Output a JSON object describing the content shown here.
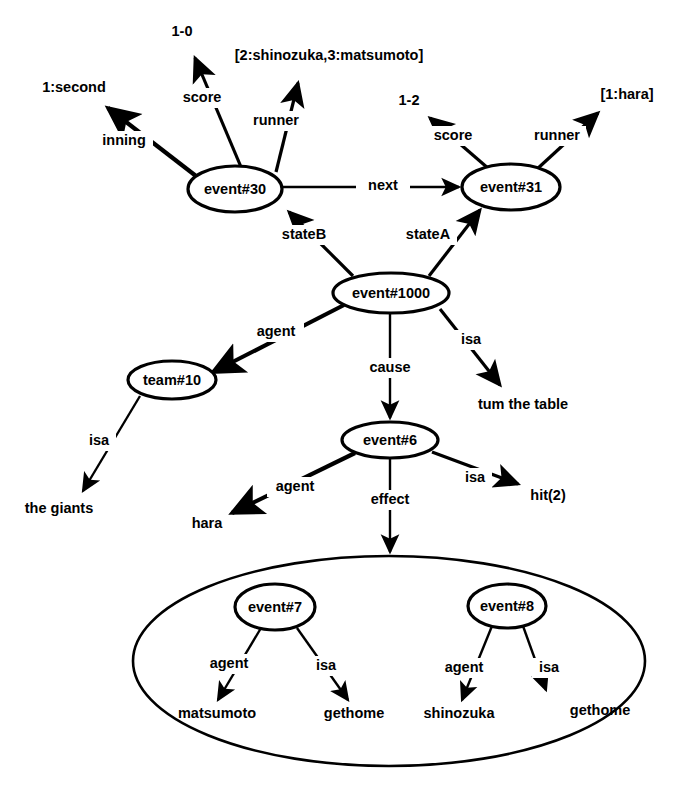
{
  "diagram": {
    "ink_color": "#000000",
    "background_color": "#ffffff",
    "nodes": {
      "event30": {
        "label": "event#30",
        "cx": 235,
        "cy": 189,
        "rx": 47,
        "ry": 23
      },
      "event31": {
        "label": "event#31",
        "cx": 511,
        "cy": 187,
        "rx": 49,
        "ry": 23
      },
      "event1000": {
        "label": "event#1000",
        "cx": 391,
        "cy": 293,
        "rx": 58,
        "ry": 20
      },
      "team10": {
        "label": "team#10",
        "cx": 172,
        "cy": 380,
        "rx": 44,
        "ry": 19
      },
      "event6": {
        "label": "event#6",
        "cx": 390,
        "cy": 440,
        "rx": 48,
        "ry": 18
      },
      "event7": {
        "label": "event#7",
        "cx": 275,
        "cy": 607,
        "rx": 40,
        "ry": 23
      },
      "event8": {
        "label": "event#8",
        "cx": 507,
        "cy": 606,
        "rx": 39,
        "ry": 22
      },
      "group": {
        "label": "",
        "cx": 389,
        "cy": 661,
        "rx": 256,
        "ry": 105
      }
    },
    "leaves": {
      "inning_value": {
        "label": "1:second",
        "x": 74,
        "y": 88
      },
      "score30_value": {
        "label": "1-0",
        "x": 182,
        "y": 32
      },
      "runner30_value": {
        "label": "[2:shinozuka,3:matsumoto]",
        "x": 329,
        "y": 56
      },
      "score31_value": {
        "label": "1-2",
        "x": 409,
        "y": 101
      },
      "runner31_value": {
        "label": "[1:hara]",
        "x": 627,
        "y": 95
      },
      "turn_the_table": {
        "label": "tum the table",
        "x": 523,
        "y": 405
      },
      "the_giants": {
        "label": "the giants",
        "x": 59,
        "y": 509
      },
      "hara": {
        "label": "hara",
        "x": 207,
        "y": 524
      },
      "hit2": {
        "label": "hit(2)",
        "x": 548,
        "y": 496
      },
      "matsumoto": {
        "label": "matsumoto",
        "x": 217,
        "y": 714
      },
      "gethome_left": {
        "label": "gethome",
        "x": 354,
        "y": 714
      },
      "shinozuka": {
        "label": "shinozuka",
        "x": 459,
        "y": 714
      },
      "gethome_right": {
        "label": "gethome",
        "x": 600,
        "y": 711
      }
    },
    "edges": [
      {
        "id": "e-inning",
        "label": "inning",
        "from": "event30",
        "to": "inning_value",
        "label_x": 124,
        "label_y": 141
      },
      {
        "id": "e-score30",
        "label": "score",
        "from": "event30",
        "to": "score30_value",
        "label_x": 202,
        "label_y": 98
      },
      {
        "id": "e-runner30",
        "label": "runner",
        "from": "event30",
        "to": "runner30_value",
        "label_x": 276,
        "label_y": 121
      },
      {
        "id": "e-next",
        "label": "next",
        "from": "event30",
        "to": "event31",
        "label_x": 383,
        "label_y": 186
      },
      {
        "id": "e-score31",
        "label": "score",
        "from": "event31",
        "to": "score31_value",
        "label_x": 453,
        "label_y": 136
      },
      {
        "id": "e-runner31",
        "label": "runner",
        "from": "event31",
        "to": "runner31_value",
        "label_x": 557,
        "label_y": 136
      },
      {
        "id": "e-stateB",
        "label": "stateB",
        "from": "event1000",
        "to": "event30",
        "label_x": 304,
        "label_y": 235
      },
      {
        "id": "e-stateA",
        "label": "stateA",
        "from": "event1000",
        "to": "event31",
        "label_x": 428,
        "label_y": 235
      },
      {
        "id": "e-agent1000",
        "label": "agent",
        "from": "event1000",
        "to": "team10",
        "label_x": 276,
        "label_y": 332
      },
      {
        "id": "e-cause",
        "label": "cause",
        "from": "event1000",
        "to": "event6",
        "label_x": 390,
        "label_y": 368
      },
      {
        "id": "e-isa1000",
        "label": "isa",
        "from": "event1000",
        "to": "turn_the_table",
        "label_x": 471,
        "label_y": 340
      },
      {
        "id": "e-isa-team",
        "label": "isa",
        "from": "team10",
        "to": "the_giants",
        "label_x": 99,
        "label_y": 441
      },
      {
        "id": "e-agent6",
        "label": "agent",
        "from": "event6",
        "to": "hara",
        "label_x": 295,
        "label_y": 487
      },
      {
        "id": "e-effect",
        "label": "effect",
        "from": "event6",
        "to": "group",
        "label_x": 390,
        "label_y": 500
      },
      {
        "id": "e-isa6",
        "label": "isa",
        "from": "event6",
        "to": "hit2",
        "label_x": 475,
        "label_y": 478
      },
      {
        "id": "e-agent7",
        "label": "agent",
        "from": "event7",
        "to": "matsumoto",
        "label_x": 229,
        "label_y": 664
      },
      {
        "id": "e-isa7",
        "label": "isa",
        "from": "event7",
        "to": "gethome_left",
        "label_x": 326,
        "label_y": 666
      },
      {
        "id": "e-agent8",
        "label": "agent",
        "from": "event8",
        "to": "shinozuka",
        "label_x": 464,
        "label_y": 668
      },
      {
        "id": "e-isa8",
        "label": "isa",
        "from": "event8",
        "to": "gethome_right",
        "label_x": 549,
        "label_y": 668
      }
    ]
  }
}
